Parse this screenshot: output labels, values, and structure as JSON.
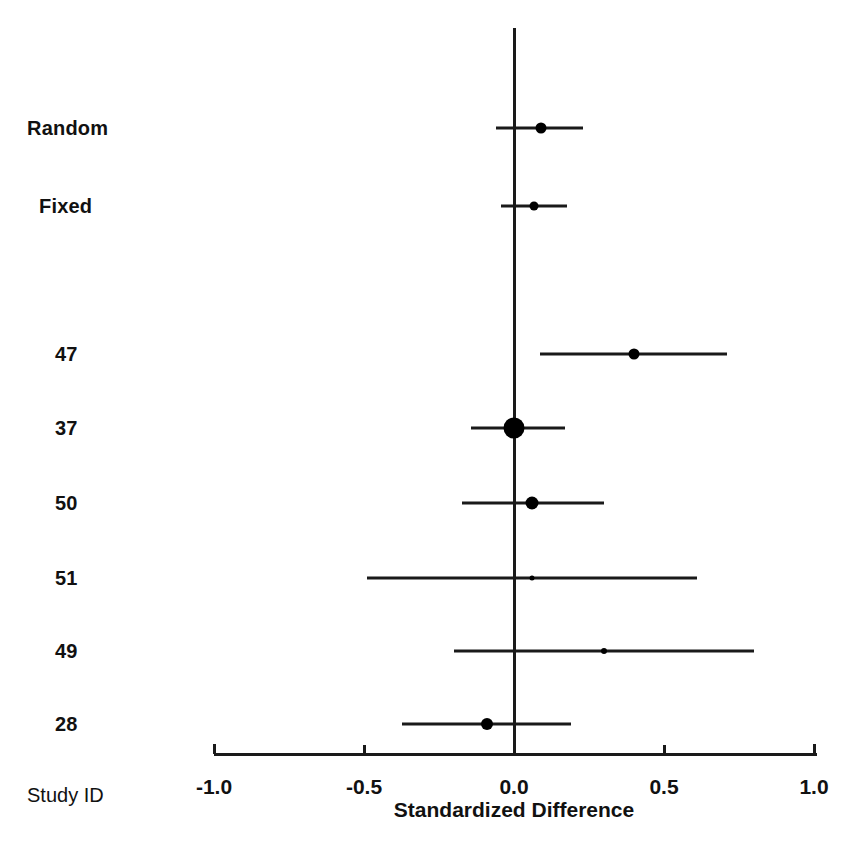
{
  "chart_data": {
    "type": "forest",
    "title": "",
    "xlabel": "Standardized Difference",
    "ylabel": "Study ID",
    "xlim": [
      -1.0,
      1.0
    ],
    "xticks": [
      -1.0,
      -0.5,
      0.0,
      0.5,
      1.0
    ],
    "xtick_labels": [
      "-1.0",
      "-0.5",
      "0.0",
      "0.5",
      "1.0"
    ],
    "grid": false,
    "reference_line": 0.0,
    "rows": [
      {
        "label": "Random",
        "kind": "summary",
        "estimate": 0.09,
        "ci_low": -0.06,
        "ci_high": 0.23,
        "marker_size": 11,
        "y": 128
      },
      {
        "label": "Fixed",
        "kind": "summary",
        "estimate": 0.065,
        "ci_low": -0.045,
        "ci_high": 0.175,
        "marker_size": 9,
        "y": 206
      },
      {
        "label": "47",
        "kind": "study",
        "estimate": 0.4,
        "ci_low": 0.085,
        "ci_high": 0.71,
        "marker_size": 11,
        "y": 354
      },
      {
        "label": "37",
        "kind": "study",
        "estimate": 0.0,
        "ci_low": -0.145,
        "ci_high": 0.17,
        "marker_size": 21,
        "y": 428
      },
      {
        "label": "50",
        "kind": "study",
        "estimate": 0.06,
        "ci_low": -0.175,
        "ci_high": 0.3,
        "marker_size": 13,
        "y": 503
      },
      {
        "label": "51",
        "kind": "study",
        "estimate": 0.06,
        "ci_low": -0.49,
        "ci_high": 0.61,
        "marker_size": 5,
        "y": 578
      },
      {
        "label": "49",
        "kind": "study",
        "estimate": 0.3,
        "ci_low": -0.2,
        "ci_high": 0.8,
        "marker_size": 6,
        "y": 651
      },
      {
        "label": "28",
        "kind": "study",
        "estimate": -0.09,
        "ci_low": -0.375,
        "ci_high": 0.19,
        "marker_size": 12,
        "y": 724
      }
    ]
  },
  "labels": {
    "row_0": "Random",
    "row_1": "Fixed",
    "row_2": "47",
    "row_3": "37",
    "row_4": "50",
    "row_5": "51",
    "row_6": "49",
    "row_7": "28",
    "study_id": "Study ID",
    "x_title": "Standardized Difference",
    "tick_neg_1": "-1.0",
    "tick_neg_05": "-0.5",
    "tick_0": "0.0",
    "tick_05": "0.5",
    "tick_1": "1.0"
  },
  "colors": {
    "ink": "#1a1a1a",
    "background": "#ffffff"
  }
}
